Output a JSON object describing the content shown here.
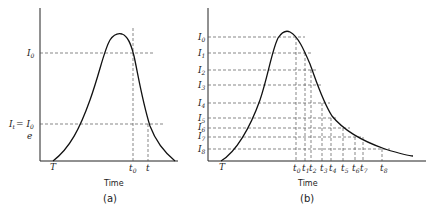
{
  "panel_a": {
    "caption": "(a)",
    "xlabel": "Time",
    "y_labels": {
      "I0": {
        "main": "I",
        "sub": "0"
      },
      "It": {
        "main": "I",
        "sub": "t",
        "eq": "= I",
        "eq_sub": "0",
        "denom": "e"
      }
    },
    "x_labels": {
      "T": "T",
      "t0": {
        "main": "t",
        "sub": "0"
      },
      "t": "t"
    }
  },
  "panel_b": {
    "caption": "(b)",
    "xlabel": "Time",
    "T": "T",
    "y_labels": [
      {
        "main": "I",
        "sub": "0"
      },
      {
        "main": "I",
        "sub": "1"
      },
      {
        "main": "I",
        "sub": "2"
      },
      {
        "main": "I",
        "sub": "3"
      },
      {
        "main": "I",
        "sub": "4"
      },
      {
        "main": "I",
        "sub": "5"
      },
      {
        "main": "I",
        "sub": "6"
      },
      {
        "main": "I",
        "sub": "7"
      },
      {
        "main": "I",
        "sub": "8"
      }
    ],
    "x_labels": [
      {
        "main": "t",
        "sub": "0"
      },
      {
        "main": "t",
        "sub": "1"
      },
      {
        "main": "t",
        "sub": "2"
      },
      {
        "main": "t",
        "sub": "3"
      },
      {
        "main": "t",
        "sub": "4"
      },
      {
        "main": "t",
        "sub": "5"
      },
      {
        "main": "t",
        "sub": "6"
      },
      {
        "main": "t",
        "sub": "7"
      },
      {
        "main": "t",
        "sub": "8"
      }
    ]
  }
}
